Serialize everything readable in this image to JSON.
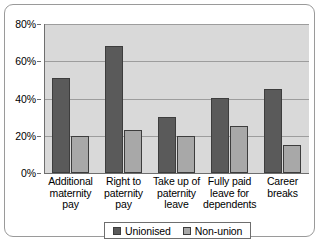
{
  "chart_data": {
    "type": "bar",
    "title": "",
    "xlabel": "",
    "ylabel": "",
    "categories": [
      "Additional maternity pay",
      "Right to paternity pay",
      "Take up of paternity leave",
      "Fully paid leave for dependents",
      "Career breaks"
    ],
    "category_lines": [
      [
        "Additional",
        "maternity",
        "pay"
      ],
      [
        "Right to",
        "paternity",
        "pay"
      ],
      [
        "Take up of",
        "paternity",
        "leave"
      ],
      [
        "Fully paid",
        "leave for",
        "dependents"
      ],
      [
        "Career",
        "breaks"
      ]
    ],
    "series": [
      {
        "name": "Unionised",
        "color": "#5a5a5a",
        "values": [
          51,
          68,
          30,
          40,
          45
        ]
      },
      {
        "name": "Non-union",
        "color": "#a8a8a8",
        "values": [
          20,
          23,
          20,
          25,
          15
        ]
      }
    ],
    "ylim": [
      0,
      80
    ],
    "ytick_values": [
      0,
      20,
      40,
      60,
      80
    ],
    "ytick_labels": [
      "0%",
      "20%",
      "40%",
      "60%",
      "80%"
    ],
    "grid": true,
    "legend_position": "bottom-center",
    "plot_background": "#d9d9d9",
    "axis_color": "#6e6e6e",
    "gridline_color": "#9d9d9d"
  },
  "legend": {
    "entries": [
      {
        "label": "Unionised"
      },
      {
        "label": "Non-union"
      }
    ]
  }
}
